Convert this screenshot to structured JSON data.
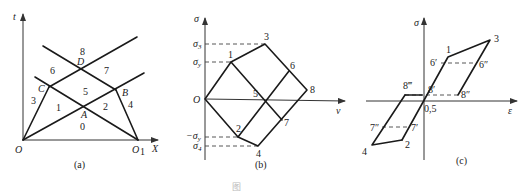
{
  "panels": [
    {
      "id": "a",
      "caption": "(a)",
      "axes": {
        "x_label": "X",
        "y_label": "t"
      },
      "origin_labels": {
        "origin": "O",
        "far": "O",
        "far_sub": "1"
      },
      "points": {
        "A": "A",
        "B": "B",
        "C": "C",
        "D": "D"
      },
      "regions": [
        "0",
        "1",
        "2",
        "3",
        "4",
        "5",
        "6",
        "7",
        "8"
      ]
    },
    {
      "id": "b",
      "caption": "(b)",
      "axes": {
        "x_label": "v",
        "y_label": "σ"
      },
      "origin_label": "O",
      "tick_labels": {
        "sigma3": "σ",
        "sigma3_sub": "3",
        "sigmay": "σ",
        "sigmay_sub": "y",
        "neg_sigmay": "−σ",
        "neg_sigmay_sub": "y",
        "sigma4": "σ",
        "sigma4_sub": "4"
      },
      "points": [
        "1",
        "2",
        "3",
        "4",
        "5",
        "6",
        "7",
        "8"
      ]
    },
    {
      "id": "c",
      "caption": "(c)",
      "axes": {
        "x_label": "ε",
        "y_label": "σ"
      },
      "origin_label": "0,5",
      "points": {
        "p1": "1",
        "p2": "2",
        "p3": "3",
        "p4": "4",
        "p6p": "6′",
        "p6pp": "6″",
        "p7p": "7′",
        "p7pp": "7″",
        "p8p": "8′",
        "p8pp": "8″",
        "p8ppp": "8‴"
      }
    }
  ],
  "figure_caption": "图"
}
